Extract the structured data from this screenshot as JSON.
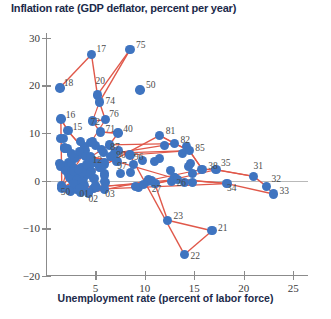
{
  "chart_data": {
    "type": "scatter",
    "title": "Inflation rate (GDP deflator, percent per year)",
    "xlabel": "Unemployment rate (percent of labor force)",
    "ylabel": "Inflation rate (GDP deflator, percent per year)",
    "xlim": [
      0,
      26.5
    ],
    "ylim": [
      -20,
      31
    ],
    "xticks": [
      5,
      10,
      15,
      20,
      25
    ],
    "yticks": [
      30,
      20,
      10,
      0,
      -10,
      -20
    ],
    "grid": false,
    "legend": null,
    "connected": true,
    "marker_color": "#3f74c0",
    "line_color": "#e0584a",
    "zero_line": 0,
    "point_label_key": "year (last two digits)",
    "points": [
      {
        "label": "17",
        "x": 4.6,
        "y": 26.5,
        "dx": 5,
        "dy": -4
      },
      {
        "label": "18",
        "x": 1.4,
        "y": 19.5,
        "dx": 4,
        "dy": -4
      },
      {
        "label": "20",
        "x": 5.2,
        "y": 18.0,
        "dx": -2,
        "dy": -13
      },
      {
        "label": "75",
        "x": 8.5,
        "y": 27.5,
        "dx": 6,
        "dy": -4
      },
      {
        "label": "50",
        "x": 9.5,
        "y": 19.0,
        "dx": 6,
        "dy": -4
      },
      {
        "label": "74",
        "x": 5.4,
        "y": 16.5,
        "dx": 6,
        "dy": 0
      },
      {
        "label": "16",
        "x": 1.5,
        "y": 13.0,
        "dx": 5,
        "dy": -3
      },
      {
        "label": "72",
        "x": 4.7,
        "y": 12.5,
        "dx": -2,
        "dy": 2
      },
      {
        "label": "76",
        "x": 6.0,
        "y": 12.8,
        "dx": 4,
        "dy": -5
      },
      {
        "label": "15",
        "x": 2.2,
        "y": 10.5,
        "dx": 5,
        "dy": -3
      },
      {
        "label": "71",
        "x": 5.5,
        "y": 10.2,
        "dx": 5,
        "dy": -2
      },
      {
        "label": "40",
        "x": 7.3,
        "y": 10.0,
        "dx": 5,
        "dy": -3
      },
      {
        "label": "81",
        "x": 11.5,
        "y": 9.5,
        "dx": 6,
        "dy": -3
      },
      {
        "label": "82",
        "x": 13.0,
        "y": 7.8,
        "dx": 6,
        "dy": -3
      },
      {
        "label": "87",
        "x": 6.4,
        "y": 7.5,
        "dx": 1,
        "dy": 3
      },
      {
        "label": "85",
        "x": 14.5,
        "y": 6.3,
        "dx": 6,
        "dy": -2
      },
      {
        "label": "90",
        "x": 7.0,
        "y": 5.8,
        "dx": 1,
        "dy": 3
      },
      {
        "label": "96",
        "x": 8.5,
        "y": 5.4,
        "dx": 4,
        "dy": 3
      },
      {
        "label": "12",
        "x": 4.5,
        "y": 5.0,
        "dx": 2,
        "dy": 4
      },
      {
        "label": "97",
        "x": 7.2,
        "y": 4.0,
        "dx": 0,
        "dy": 5
      },
      {
        "label": "1xx",
        "x": 2.6,
        "y": 5.6,
        "dx": 0,
        "dy": 0
      },
      {
        "label": "38",
        "x": 15.8,
        "y": 2.4,
        "dx": 6,
        "dy": -2
      },
      {
        "label": "35",
        "x": 17.2,
        "y": 2.3,
        "dx": 5,
        "dy": -6
      },
      {
        "label": "31",
        "x": 21.0,
        "y": 0.9,
        "dx": 0,
        "dy": -9
      },
      {
        "label": "32",
        "x": 22.3,
        "y": -1.2,
        "dx": 5,
        "dy": -6
      },
      {
        "label": "33",
        "x": 23.0,
        "y": -2.8,
        "dx": 6,
        "dy": -2
      },
      {
        "label": "34",
        "x": 18.3,
        "y": -0.6,
        "dx": 0,
        "dy": 5
      },
      {
        "label": "26",
        "x": 13.3,
        "y": 0.3,
        "dx": -1,
        "dy": 5
      },
      {
        "label": "27",
        "x": 11.0,
        "y": -0.6,
        "dx": -3,
        "dy": 6
      },
      {
        "label": "50",
        "x": 1.6,
        "y": -1.5,
        "dx": -1,
        "dy": 5
      },
      {
        "label": "01",
        "x": 3.4,
        "y": -1.7,
        "dx": 0,
        "dy": 6
      },
      {
        "label": "02",
        "x": 4.3,
        "y": -2.6,
        "dx": 0,
        "dy": 7
      },
      {
        "label": "03",
        "x": 5.9,
        "y": -1.7,
        "dx": 1,
        "dy": 6
      },
      {
        "label": "23",
        "x": 12.3,
        "y": -8.3,
        "dx": 6,
        "dy": -3
      },
      {
        "label": "21",
        "x": 16.8,
        "y": -10.5,
        "dx": 6,
        "dy": -2
      },
      {
        "label": "22",
        "x": 14.0,
        "y": -15.5,
        "dx": 6,
        "dy": 2
      }
    ],
    "path_order": [
      "18",
      "17",
      "20",
      "75",
      "74",
      "76",
      "72",
      "71",
      "40",
      "87",
      "90",
      "97",
      "12",
      "15",
      "16",
      "50",
      "81",
      "82",
      "85",
      "38",
      "35",
      "31",
      "32",
      "33",
      "34",
      "26",
      "27",
      "23",
      "21",
      "22",
      "96"
    ],
    "cluster_note": "dense overlapping cluster of points near 2-5% unemployment, 0-9% inflation"
  }
}
